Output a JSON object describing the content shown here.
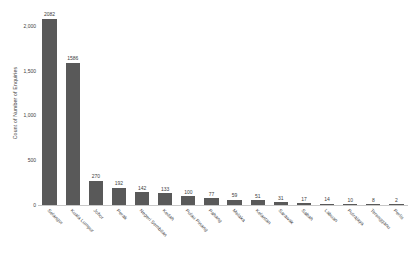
{
  "chart_data": {
    "type": "bar",
    "title": "",
    "subtitle": "",
    "xlabel": "",
    "ylabel": "Count of Number of Enquiries",
    "ylim": [
      0,
      2200
    ],
    "ytick_values": [
      0,
      500,
      1000,
      1500,
      2000
    ],
    "ytick_labels": [
      "0",
      "500",
      "1,000",
      "1,500",
      "2,000"
    ],
    "grid": false,
    "legend": false,
    "legend_position": "none",
    "bar_color": "#595959",
    "value_labels_shown": true,
    "xtick_rotation": 45,
    "categories": [
      "Selangor",
      "Kuala Lumpur",
      "Johor",
      "Perak",
      "Negeri Sembilan",
      "Kedah",
      "Pulau Pinang",
      "Pahang",
      "Melaka",
      "Kelantan",
      "Sarawak",
      "Sabah",
      "Labuan",
      "Putrajaya",
      "Terengganu",
      "Perlis"
    ],
    "values": [
      2082,
      1586,
      270,
      192,
      142,
      133,
      100,
      77,
      59,
      51,
      31,
      17,
      14,
      10,
      8,
      2
    ],
    "value_label_texts": [
      "2082",
      "1586",
      "270",
      "192",
      "142",
      "133",
      "100",
      "77",
      "59",
      "51",
      "31",
      "17",
      "14",
      "10",
      "8",
      "2"
    ]
  },
  "colors": {
    "bar": "#595959",
    "axis": "#c8c8c8",
    "text": "#3d3d3d",
    "background": "#ffffff"
  }
}
